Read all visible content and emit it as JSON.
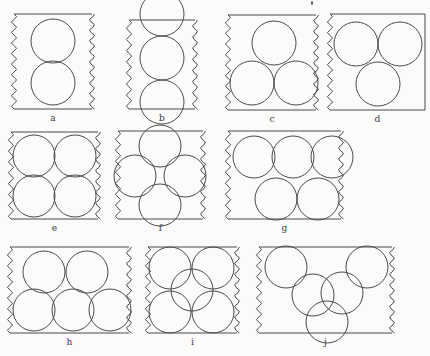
{
  "figure": {
    "title": "",
    "background_color": "#fbfbfa",
    "stroke_color": "#4a4a4a",
    "fill_color": "none",
    "width": 415,
    "height": 356,
    "labels": {
      "a": "a",
      "b": "b",
      "c": "c",
      "d": "d",
      "e": "e",
      "f": "f",
      "g": "g",
      "h": "h",
      "i": "i",
      "j": "j"
    },
    "panels": [
      {
        "id": "a",
        "label": "a",
        "x": 14,
        "y": 14,
        "w": 78,
        "h": 95,
        "circle_count": 2,
        "arrangement": "two stacked vertically, centred",
        "radius": 22,
        "circles": [
          {
            "cx": 39,
            "cy": 27,
            "r": 22
          },
          {
            "cx": 39,
            "cy": 69,
            "r": 22
          }
        ],
        "wavy_edges": [
          "left",
          "right"
        ]
      },
      {
        "id": "b",
        "label": "b",
        "x": 129,
        "y": 20,
        "w": 66,
        "h": 89,
        "circle_count": 3,
        "arrangement": "three stacked vertically in a column, top circle protruding above the top edge",
        "radius": 22,
        "circles": [
          {
            "cx": 33,
            "cy": -6,
            "r": 22
          },
          {
            "cx": 33,
            "cy": 38,
            "r": 22
          },
          {
            "cx": 33,
            "cy": 82,
            "r": 22
          }
        ],
        "wavy_edges": [
          "left",
          "right"
        ]
      },
      {
        "id": "c",
        "label": "c",
        "x": 228,
        "y": 15,
        "w": 88,
        "h": 95,
        "circle_count": 3,
        "arrangement": "triangular: one top-centre, two bottom",
        "radius": 22,
        "circles": [
          {
            "cx": 46,
            "cy": 28,
            "r": 22
          },
          {
            "cx": 24,
            "cy": 68,
            "r": 22
          },
          {
            "cx": 68,
            "cy": 68,
            "r": 22
          }
        ],
        "wavy_edges": [
          "left",
          "right"
        ]
      },
      {
        "id": "d",
        "label": "d",
        "x": 330,
        "y": 14,
        "w": 95,
        "h": 96,
        "circle_count": 3,
        "arrangement": "two on top row, one below centre-left (panel clipped at image edge)",
        "radius": 22,
        "circles": [
          {
            "cx": 26,
            "cy": 30,
            "r": 22
          },
          {
            "cx": 70,
            "cy": 30,
            "r": 22
          },
          {
            "cx": 48,
            "cy": 70,
            "r": 22
          }
        ],
        "wavy_edges": [
          "left"
        ]
      },
      {
        "id": "e",
        "label": "e",
        "x": 11,
        "y": 132,
        "w": 87,
        "h": 87,
        "circle_count": 4,
        "arrangement": "two by two square grid",
        "radius": 21,
        "circles": [
          {
            "cx": 23,
            "cy": 24,
            "r": 21
          },
          {
            "cx": 64,
            "cy": 24,
            "r": 21
          },
          {
            "cx": 23,
            "cy": 64,
            "r": 21
          },
          {
            "cx": 64,
            "cy": 64,
            "r": 21
          }
        ],
        "wavy_edges": [
          "left",
          "right"
        ]
      },
      {
        "id": "f",
        "label": "f",
        "x": 118,
        "y": 131,
        "w": 85,
        "h": 88,
        "circle_count": 4,
        "arrangement": "diamond rosette: top, left, right and bottom circles mutually touching",
        "radius": 21,
        "circles": [
          {
            "cx": 42,
            "cy": 15,
            "r": 21
          },
          {
            "cx": 17,
            "cy": 45,
            "r": 21
          },
          {
            "cx": 67,
            "cy": 45,
            "r": 21
          },
          {
            "cx": 42,
            "cy": 74,
            "r": 21
          }
        ],
        "wavy_edges": [
          "left",
          "right"
        ]
      },
      {
        "id": "g",
        "label": "g",
        "x": 228,
        "y": 131,
        "w": 113,
        "h": 88,
        "circle_count": 5,
        "arrangement": "three on the top row, two on the bottom row",
        "radius": 21,
        "circles": [
          {
            "cx": 26,
            "cy": 26,
            "r": 21
          },
          {
            "cx": 65,
            "cy": 26,
            "r": 21
          },
          {
            "cx": 104,
            "cy": 26,
            "r": 21
          },
          {
            "cx": 48,
            "cy": 68,
            "r": 21
          },
          {
            "cx": 90,
            "cy": 68,
            "r": 21
          }
        ],
        "wavy_edges": [
          "left",
          "right"
        ]
      },
      {
        "id": "h",
        "label": "h",
        "x": 10,
        "y": 247,
        "w": 119,
        "h": 86,
        "circle_count": 5,
        "arrangement": "two on the top row, three touching on the bottom row",
        "radius": 21,
        "circles": [
          {
            "cx": 34,
            "cy": 25,
            "r": 21
          },
          {
            "cx": 77,
            "cy": 25,
            "r": 21
          },
          {
            "cx": 24,
            "cy": 63,
            "r": 21
          },
          {
            "cx": 63,
            "cy": 63,
            "r": 21
          },
          {
            "cx": 100,
            "cy": 63,
            "r": 21
          }
        ],
        "wavy_edges": [
          "left",
          "right"
        ]
      },
      {
        "id": "i",
        "label": "i",
        "x": 148,
        "y": 247,
        "w": 89,
        "h": 86,
        "circle_count": 5,
        "arrangement": "quincunx: four at the corners plus one in the centre, all touching",
        "radius": 21,
        "circles": [
          {
            "cx": 22,
            "cy": 21,
            "r": 21
          },
          {
            "cx": 65,
            "cy": 21,
            "r": 21
          },
          {
            "cx": 44,
            "cy": 43,
            "r": 21
          },
          {
            "cx": 22,
            "cy": 65,
            "r": 21
          },
          {
            "cx": 65,
            "cy": 65,
            "r": 21
          }
        ],
        "wavy_edges": [
          "left",
          "right"
        ]
      },
      {
        "id": "j",
        "label": "j",
        "x": 259,
        "y": 247,
        "w": 133,
        "h": 86,
        "circle_count": 5,
        "arrangement": "V / chevron chain: two upper corners, two mid, one bottom centre",
        "radius": 21,
        "circles": [
          {
            "cx": 27,
            "cy": 20,
            "r": 21
          },
          {
            "cx": 108,
            "cy": 20,
            "r": 21
          },
          {
            "cx": 54,
            "cy": 48,
            "r": 21
          },
          {
            "cx": 83,
            "cy": 46,
            "r": 21
          },
          {
            "cx": 68,
            "cy": 75,
            "r": 21
          }
        ],
        "wavy_edges": [
          "left",
          "right"
        ]
      }
    ]
  }
}
